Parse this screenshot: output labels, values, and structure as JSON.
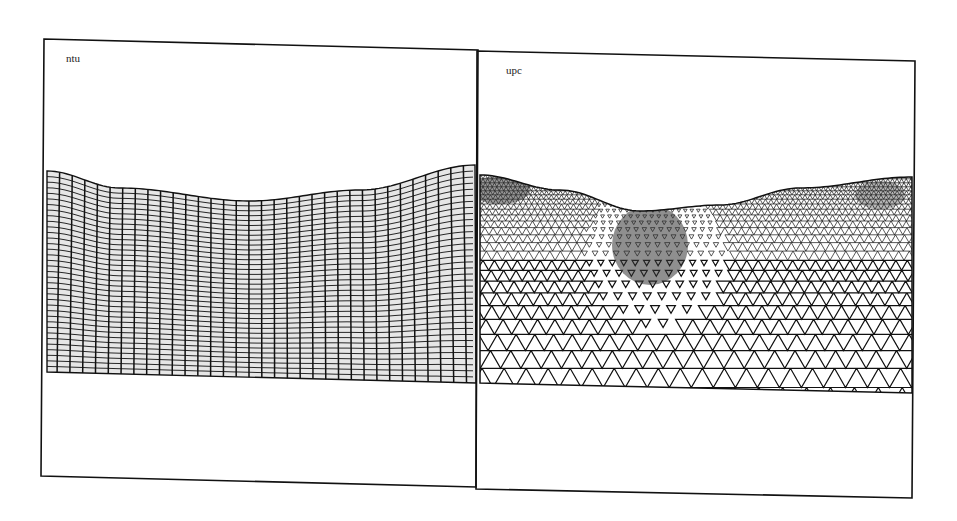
{
  "figure": {
    "panels": [
      {
        "id": "ntu",
        "label": "ntu",
        "mesh_type": "structured-quadrilateral",
        "frame": {
          "tl": [
            44,
            39
          ],
          "tr": [
            478,
            50
          ],
          "br": [
            476,
            487
          ],
          "bl": [
            41,
            476
          ]
        },
        "mesh": {
          "columns": 34,
          "rows": 36,
          "top_surface": [
            [
              47,
              171
            ],
            [
              120,
              188
            ],
            [
              250,
              201
            ],
            [
              360,
              190
            ],
            [
              476,
              165
            ]
          ],
          "bottom": [
            [
              47,
              372
            ],
            [
              476,
              383
            ]
          ]
        }
      },
      {
        "id": "upc",
        "label": "upc",
        "mesh_type": "unstructured-triangular",
        "frame": {
          "tl": [
            477,
            51
          ],
          "tr": [
            915,
            61
          ],
          "br": [
            912,
            498
          ],
          "bl": [
            476,
            489
          ]
        },
        "mesh": {
          "top_surface": [
            [
              480,
              175
            ],
            [
              560,
              190
            ],
            [
              640,
              211
            ],
            [
              720,
              205
            ],
            [
              800,
              188
            ],
            [
              912,
              177
            ]
          ],
          "bottom": [
            [
              479,
              383
            ],
            [
              912,
              393
            ]
          ],
          "refined_region_center": [
            650,
            250
          ]
        }
      }
    ],
    "colors": {
      "ink": "#111111",
      "background": "#ffffff",
      "fill": "#d8d8d8"
    }
  }
}
